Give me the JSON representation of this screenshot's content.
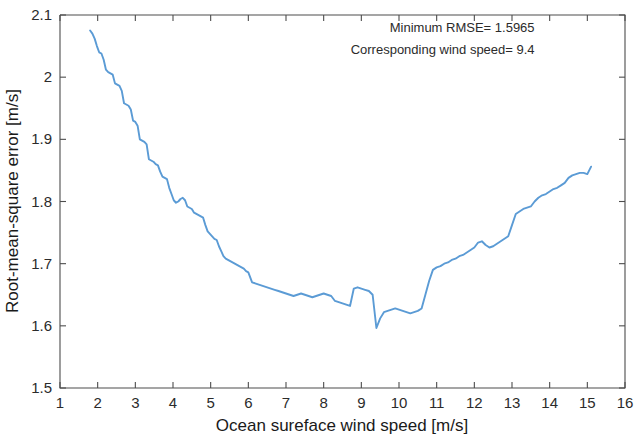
{
  "chart_data": {
    "type": "line",
    "title": "",
    "xlabel": "Ocean sureface wind speed [m/s]",
    "ylabel": "Root-mean-square error [m/s]",
    "xlim": [
      1,
      16
    ],
    "ylim": [
      1.5,
      2.1
    ],
    "xticks": [
      1,
      2,
      3,
      4,
      5,
      6,
      7,
      8,
      9,
      10,
      11,
      12,
      13,
      14,
      15,
      16
    ],
    "xticklabels": [
      "1",
      "2",
      "3",
      "4",
      "5",
      "6",
      "7",
      "8",
      "9",
      "10",
      "11",
      "12",
      "13",
      "14",
      "15",
      "16"
    ],
    "yticks": [
      1.5,
      1.6,
      1.7,
      1.8,
      1.9,
      2.0,
      2.1
    ],
    "yticklabels": [
      "1.5",
      "1.6",
      "1.7",
      "1.8",
      "1.9",
      "2",
      "2.1"
    ],
    "grid": false,
    "legend": false,
    "line_color": "#5B9BD5",
    "series": [
      {
        "name": "RMSE vs wind speed",
        "x": [
          1.8,
          1.86,
          1.92,
          1.98,
          2.04,
          2.1,
          2.16,
          2.22,
          2.28,
          2.34,
          2.4,
          2.46,
          2.52,
          2.58,
          2.64,
          2.7,
          2.76,
          2.82,
          2.88,
          2.94,
          3.0,
          3.06,
          3.12,
          3.18,
          3.24,
          3.3,
          3.36,
          3.42,
          3.48,
          3.54,
          3.6,
          3.66,
          3.72,
          3.78,
          3.84,
          3.9,
          3.96,
          4.02,
          4.08,
          4.14,
          4.2,
          4.26,
          4.32,
          4.38,
          4.44,
          4.5,
          4.56,
          4.62,
          4.68,
          4.74,
          4.8,
          4.86,
          4.92,
          4.98,
          5.04,
          5.1,
          5.16,
          5.22,
          5.28,
          5.34,
          5.4,
          5.46,
          5.52,
          5.58,
          5.64,
          5.7,
          5.76,
          5.82,
          5.88,
          5.94,
          6.0,
          6.1,
          6.2,
          6.3,
          6.4,
          6.5,
          6.6,
          6.7,
          6.8,
          6.9,
          7.0,
          7.1,
          7.2,
          7.3,
          7.4,
          7.5,
          7.6,
          7.7,
          7.8,
          7.9,
          8.0,
          8.1,
          8.2,
          8.3,
          8.4,
          8.5,
          8.6,
          8.7,
          8.8,
          8.9,
          9.0,
          9.1,
          9.2,
          9.3,
          9.4,
          9.5,
          9.6,
          9.7,
          9.8,
          9.9,
          10.0,
          10.1,
          10.2,
          10.3,
          10.4,
          10.5,
          10.6,
          10.7,
          10.8,
          10.9,
          11.0,
          11.1,
          11.2,
          11.3,
          11.4,
          11.5,
          11.6,
          11.7,
          11.8,
          11.9,
          12.0,
          12.1,
          12.2,
          12.3,
          12.4,
          12.5,
          12.6,
          12.7,
          12.8,
          12.9,
          13.0,
          13.1,
          13.2,
          13.3,
          13.4,
          13.5,
          13.6,
          13.7,
          13.8,
          13.9,
          14.0,
          14.1,
          14.2,
          14.3,
          14.4,
          14.5,
          14.6,
          14.7,
          14.8,
          14.9,
          15.0,
          15.1
        ],
        "y": [
          2.075,
          2.07,
          2.062,
          2.05,
          2.04,
          2.038,
          2.028,
          2.012,
          2.008,
          2.006,
          2.004,
          1.99,
          1.988,
          1.986,
          1.978,
          1.958,
          1.956,
          1.954,
          1.948,
          1.93,
          1.928,
          1.922,
          1.9,
          1.898,
          1.896,
          1.892,
          1.868,
          1.866,
          1.864,
          1.86,
          1.858,
          1.848,
          1.84,
          1.838,
          1.836,
          1.822,
          1.812,
          1.802,
          1.798,
          1.8,
          1.804,
          1.806,
          1.802,
          1.792,
          1.79,
          1.788,
          1.782,
          1.78,
          1.778,
          1.776,
          1.774,
          1.762,
          1.752,
          1.748,
          1.744,
          1.74,
          1.738,
          1.728,
          1.72,
          1.712,
          1.708,
          1.706,
          1.704,
          1.702,
          1.7,
          1.698,
          1.696,
          1.694,
          1.692,
          1.688,
          1.686,
          1.67,
          1.668,
          1.666,
          1.664,
          1.662,
          1.66,
          1.658,
          1.656,
          1.654,
          1.652,
          1.65,
          1.648,
          1.65,
          1.652,
          1.65,
          1.648,
          1.646,
          1.648,
          1.65,
          1.652,
          1.65,
          1.648,
          1.64,
          1.638,
          1.636,
          1.634,
          1.632,
          1.66,
          1.662,
          1.66,
          1.658,
          1.656,
          1.65,
          1.5965,
          1.612,
          1.622,
          1.624,
          1.626,
          1.628,
          1.626,
          1.624,
          1.622,
          1.62,
          1.622,
          1.624,
          1.628,
          1.65,
          1.672,
          1.69,
          1.694,
          1.696,
          1.7,
          1.702,
          1.706,
          1.708,
          1.712,
          1.714,
          1.718,
          1.722,
          1.726,
          1.734,
          1.736,
          1.73,
          1.726,
          1.728,
          1.732,
          1.736,
          1.74,
          1.744,
          1.762,
          1.78,
          1.784,
          1.788,
          1.79,
          1.792,
          1.8,
          1.806,
          1.81,
          1.812,
          1.816,
          1.82,
          1.822,
          1.826,
          1.83,
          1.838,
          1.842,
          1.844,
          1.846,
          1.846,
          1.844,
          1.856
        ]
      }
    ],
    "annotations": [
      {
        "text": "Minimum RMSE= 1.5965",
        "x": 13.6,
        "y": 2.072
      },
      {
        "text": "Corresponding wind speed= 9.4",
        "x": 13.6,
        "y": 2.038
      }
    ],
    "minimum_rmse": 1.5965,
    "corresponding_wind_speed": 9.4
  }
}
